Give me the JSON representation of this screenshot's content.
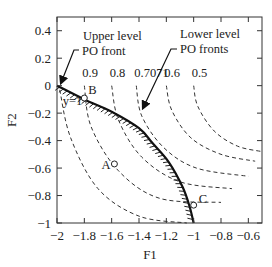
{
  "chart_data": {
    "type": "line",
    "title": "",
    "xlabel": "F1",
    "ylabel": "F2",
    "xlim": [
      -2,
      -0.5
    ],
    "ylim": [
      -1,
      0.5
    ],
    "xticks": [
      "-2",
      "-1.8",
      "-1.6",
      "-1.4",
      "-1.2",
      "-1",
      "-0.8",
      "-0.6"
    ],
    "xtick_values": [
      -2,
      -1.8,
      -1.6,
      -1.4,
      -1.2,
      -1,
      -0.8,
      -0.6
    ],
    "yticks": [
      "0.4",
      "0.2",
      "0",
      "-0.2",
      "-0.4",
      "-0.6",
      "-0.8",
      "-1"
    ],
    "ytick_values": [
      0.4,
      0.2,
      0,
      -0.2,
      -0.4,
      -0.6,
      -0.8,
      -1
    ],
    "grid": false,
    "upper_front": {
      "name": "Upper level PO front",
      "points": [
        [
          -2,
          0
        ],
        [
          -1.8,
          -0.1
        ],
        [
          -1.6,
          -0.19
        ],
        [
          -1.4,
          -0.31
        ],
        [
          -1.3,
          -0.42
        ],
        [
          -1.18,
          -0.56
        ],
        [
          -1.08,
          -0.74
        ],
        [
          -1.03,
          -0.88
        ],
        [
          -1,
          -1
        ]
      ]
    },
    "lower_fronts": [
      {
        "label": "y=1",
        "points": [
          [
            -1.98,
            -0.03
          ],
          [
            -1.9,
            -0.38
          ],
          [
            -1.7,
            -0.75
          ],
          [
            -1.4,
            -0.95
          ],
          [
            -1.05,
            -1
          ]
        ]
      },
      {
        "label": "0.9",
        "points": [
          [
            -1.8,
            0
          ],
          [
            -1.75,
            -0.3
          ],
          [
            -1.55,
            -0.62
          ],
          [
            -1.25,
            -0.82
          ],
          [
            -0.8,
            -0.85
          ]
        ]
      },
      {
        "label": "0.8",
        "points": [
          [
            -1.6,
            0
          ],
          [
            -1.55,
            -0.25
          ],
          [
            -1.38,
            -0.52
          ],
          [
            -1.1,
            -0.7
          ],
          [
            -0.72,
            -0.75
          ]
        ]
      },
      {
        "label": "0.7071",
        "points": [
          [
            -1.42,
            0
          ],
          [
            -1.38,
            -0.22
          ],
          [
            -1.22,
            -0.45
          ],
          [
            -0.98,
            -0.6
          ],
          [
            -0.6,
            -0.66
          ]
        ]
      },
      {
        "label": "0.6",
        "points": [
          [
            -1.2,
            0
          ],
          [
            -1.16,
            -0.18
          ],
          [
            -1.02,
            -0.38
          ],
          [
            -0.8,
            -0.5
          ],
          [
            -0.55,
            -0.55
          ]
        ]
      },
      {
        "label": "0.5",
        "points": [
          [
            -1,
            0
          ],
          [
            -0.97,
            -0.15
          ],
          [
            -0.85,
            -0.33
          ],
          [
            -0.68,
            -0.44
          ],
          [
            -0.5,
            -0.48
          ]
        ]
      }
    ],
    "points": [
      {
        "label": "A",
        "x": -1.58,
        "y": -0.57
      },
      {
        "label": "B",
        "x": -1.8,
        "y": -0.09
      },
      {
        "label": "C",
        "x": -1,
        "y": -0.87
      }
    ],
    "annotations": {
      "upper_line1": "Upper level",
      "upper_line2": "PO front",
      "lower_line1": "Lower level",
      "lower_line2": "PO fronts"
    },
    "legend": "none"
  }
}
